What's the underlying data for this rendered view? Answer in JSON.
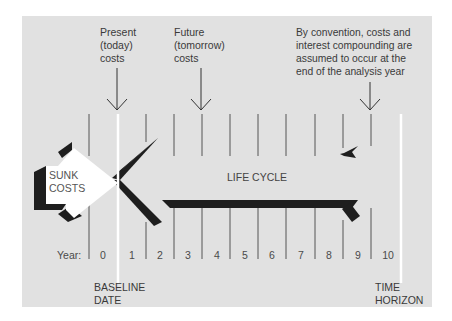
{
  "annotations": {
    "present": "Present\n(today)\ncosts",
    "future": "Future\n(tomorrow)\ncosts",
    "convention": "By convention, costs and\ninterest compounding are\nassumed to occur at the\nend of the analysis year"
  },
  "labels": {
    "sunk_costs": "SUNK\nCOSTS",
    "life_cycle": "LIFE CYCLE",
    "year_label": "Year:",
    "baseline_date": "BASELINE\nDATE",
    "time_horizon": "TIME\nHORIZON"
  },
  "years": [
    "0",
    "1",
    "2",
    "3",
    "4",
    "5",
    "6",
    "7",
    "8",
    "9",
    "10"
  ],
  "colors": {
    "panel": "#e1e1e1",
    "ink": "#1e1e1e",
    "tick": "#555555",
    "highlight": "#ffffff"
  }
}
